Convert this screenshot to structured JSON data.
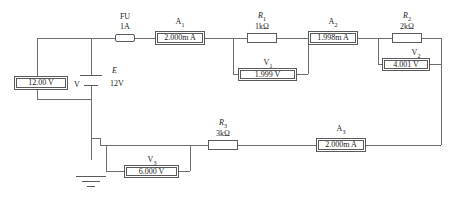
{
  "diagram": {
    "line_color": "#6e6e6e"
  },
  "source": {
    "symbol_name": "battery",
    "designator": "E",
    "value": "12V"
  },
  "ground": {
    "symbol_name": "earth-ground"
  },
  "fuse": {
    "designator": "FU",
    "rating": "1A"
  },
  "resistors": [
    {
      "designator": "R",
      "index": "1",
      "value": "1kΩ"
    },
    {
      "designator": "R",
      "index": "2",
      "value": "2kΩ"
    },
    {
      "designator": "R",
      "index": "3",
      "value": "3kΩ"
    }
  ],
  "ammeters": [
    {
      "designator": "A",
      "index": "1",
      "reading": "2.000m A"
    },
    {
      "designator": "A",
      "index": "2",
      "reading": "1.998m A"
    },
    {
      "designator": "A",
      "index": "3",
      "reading": "2.000m A"
    }
  ],
  "voltmeters": [
    {
      "designator": "V",
      "index": "",
      "reading": "12.00 V"
    },
    {
      "designator": "V",
      "index": "1",
      "reading": "1.999 V"
    },
    {
      "designator": "V",
      "index": "2",
      "reading": "4.001 V"
    },
    {
      "designator": "V",
      "index": "3",
      "reading": "6.000 V"
    }
  ],
  "labels": {
    "fu_name": "FU",
    "fu_rating": "1A",
    "a1_name": "A",
    "a1_sub": "1",
    "a1_value": "2.000m A",
    "r1_name": "R",
    "r1_sub": "1",
    "r1_value": "1kΩ",
    "v1_name": "V",
    "v1_sub": "1",
    "v1_value": "1.999 V",
    "a2_name": "A",
    "a2_sub": "2",
    "a2_value": "1.998m A",
    "r2_name": "R",
    "r2_sub": "2",
    "r2_value": "2kΩ",
    "v2_name": "V",
    "v2_sub": "2",
    "v2_value": "4.001 V",
    "r3_name": "R",
    "r3_sub": "3",
    "r3_value": "3kΩ",
    "v3_name": "V",
    "v3_sub": "3",
    "v3_value": "6.000 V",
    "a3_name": "A",
    "a3_sub": "3",
    "a3_value": "2.000m A",
    "vmain_value": "12.00 V",
    "vmain_name": "V",
    "e_name": "E",
    "e_value": "12V"
  }
}
